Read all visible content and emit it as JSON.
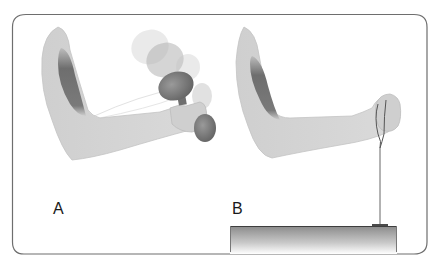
{
  "figure": {
    "panels": [
      {
        "id": "A",
        "label": "A",
        "description": "Arm performing dumbbell curl (isotonic) with motion ghosting of the dumbbell"
      },
      {
        "id": "B",
        "label": "B",
        "description": "Arm pulling against a cord anchored to a fixed block (isometric)"
      }
    ],
    "colors": {
      "frame": "#6e6e6e",
      "arm": "#d4d4d4",
      "arm_outline": "#bdbdbd",
      "muscle": "#7a7a7a",
      "dumbbell": "#7f7f7f",
      "dumbbell_ghost": "#c8c8c8",
      "cord": "#555555",
      "block_top": "#6a6a6a",
      "block_bottom": "#ffffff"
    }
  }
}
